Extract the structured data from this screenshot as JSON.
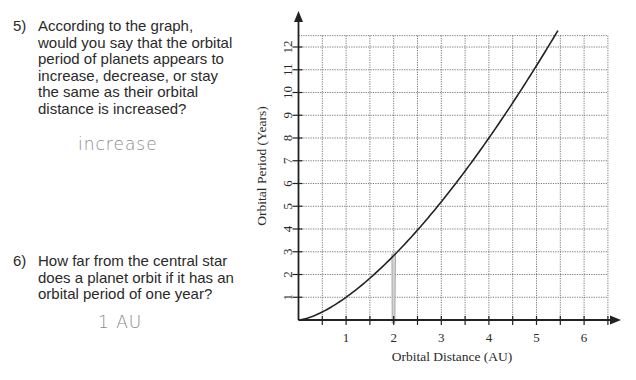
{
  "questions": [
    {
      "number": "5)",
      "lines": [
        "According to the graph,",
        "would you say that the orbital",
        "period of planets appears to",
        "increase, decrease, or stay",
        "the same as their orbital",
        "distance is increased?"
      ],
      "answer": "increase"
    },
    {
      "number": "6)",
      "lines": [
        "How far from the central star",
        "does a planet orbit if it has an",
        "orbital period of one year?"
      ],
      "answer": "1 AU"
    }
  ],
  "chart_data": {
    "type": "line",
    "title": "",
    "xlabel": "Orbital Distance (AU)",
    "ylabel": "Orbital Period (Years)",
    "xlim": [
      0,
      6.5
    ],
    "ylim": [
      0,
      12.5
    ],
    "x_ticks": [
      "1",
      "2",
      "3",
      "4",
      "5",
      "6"
    ],
    "y_ticks": [
      "1",
      "2",
      "3",
      "4",
      "5",
      "6",
      "7",
      "8",
      "9",
      "10",
      "11",
      "12"
    ],
    "grid": true,
    "x_grid_step": 0.5,
    "y_grid_step": 1,
    "series": [
      {
        "name": "Orbital Period vs Distance",
        "x": [
          0,
          0.5,
          1,
          1.5,
          2,
          2.5,
          3,
          3.5,
          4,
          4.5,
          5,
          5.45
        ],
        "values": [
          0,
          0.35,
          1,
          1.84,
          2.83,
          3.95,
          5.2,
          6.55,
          8,
          9.55,
          11.18,
          12.72
        ]
      }
    ],
    "annotations": [
      {
        "type": "pencil-mark",
        "x": 2,
        "y_from": 0,
        "y_to": 2.9
      }
    ]
  }
}
